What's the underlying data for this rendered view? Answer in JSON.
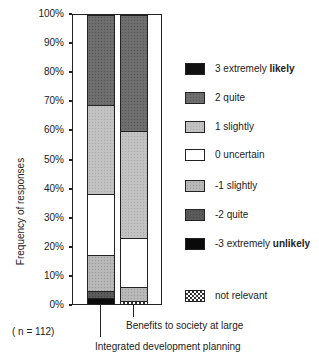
{
  "chart_data": {
    "type": "bar",
    "stacked": true,
    "percent": true,
    "title": "",
    "xlabel": "",
    "ylabel": "Frequency of responses",
    "ylim": [
      0,
      100
    ],
    "yticks": [
      "0%",
      "10%",
      "20%",
      "30%",
      "40%",
      "50%",
      "60%",
      "70%",
      "80%",
      "90%",
      "100%"
    ],
    "categories": [
      "Integrated development planning",
      "Benefits to society at large"
    ],
    "series": [
      {
        "name": "not relevant",
        "key": "nr",
        "values": [
          0,
          1
        ]
      },
      {
        "name": "-3 extremely unlikely",
        "key": "m3",
        "values": [
          2,
          0
        ]
      },
      {
        "name": "-2 quite",
        "key": "m2",
        "values": [
          2.5,
          0
        ]
      },
      {
        "name": "-1 slightly",
        "key": "m1",
        "values": [
          12.5,
          5
        ]
      },
      {
        "name": "0 uncertain",
        "key": "0",
        "values": [
          21,
          17
        ]
      },
      {
        "name": "1 slightly",
        "key": "1",
        "values": [
          31,
          37
        ]
      },
      {
        "name": "2 quite",
        "key": "2",
        "values": [
          31,
          40
        ]
      },
      {
        "name": "3 extremely likely",
        "key": "3",
        "values": [
          0,
          0
        ]
      }
    ],
    "annotation": "( n = 112)",
    "legend_position": "right"
  },
  "legend": [
    {
      "key": "3",
      "prefix": "3 extremely ",
      "bold": "likely"
    },
    {
      "key": "2",
      "prefix": "2 quite",
      "bold": ""
    },
    {
      "key": "1",
      "prefix": "1 slightly",
      "bold": ""
    },
    {
      "key": "0",
      "prefix": "0 uncertain",
      "bold": ""
    },
    {
      "key": "m1",
      "prefix": "-1 slightly",
      "bold": ""
    },
    {
      "key": "m2",
      "prefix": "-2 quite",
      "bold": ""
    },
    {
      "key": "m3",
      "prefix": "-3 extremely ",
      "bold": "unlikely"
    },
    {
      "key": "nr",
      "prefix": "not relevant",
      "bold": ""
    }
  ],
  "axis": {
    "ylabel": "Frequency of responses"
  },
  "note": "( n = 112)",
  "labels": {
    "cat1": "Integrated development planning",
    "cat2": "Benefits to society at large"
  }
}
